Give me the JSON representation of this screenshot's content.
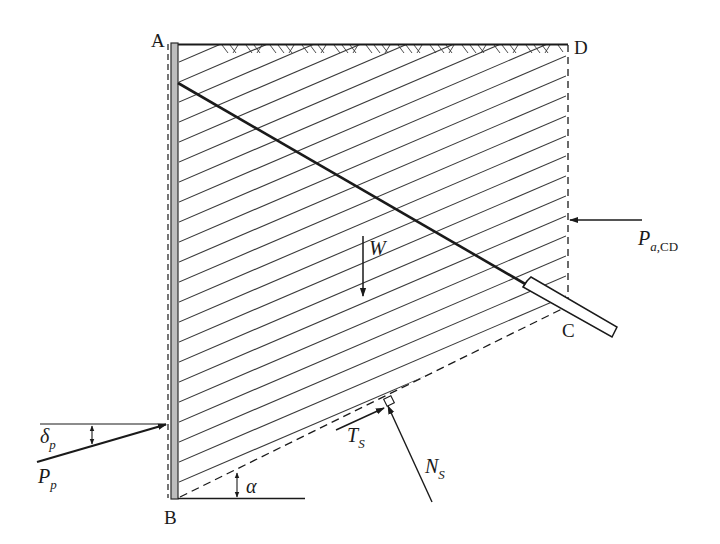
{
  "diagram": {
    "type": "retaining-wall-anchor-stability-wedge",
    "points": [
      {
        "id": "A",
        "label": "A"
      },
      {
        "id": "B",
        "label": "B"
      },
      {
        "id": "C",
        "label": "C"
      },
      {
        "id": "D",
        "label": "D"
      }
    ],
    "forces": {
      "weight": {
        "symbol": "W"
      },
      "active_pressure": {
        "symbol": "P",
        "subscript_italic": "a",
        "subscript_roman": ",CD"
      },
      "passive_pressure": {
        "symbol": "P",
        "subscript": "p"
      },
      "passive_angle": {
        "symbol": "δ",
        "subscript": "p"
      },
      "shear_force": {
        "symbol": "T",
        "subscript": "S"
      },
      "normal_force": {
        "symbol": "N",
        "subscript": "S"
      },
      "base_angle": {
        "symbol": "α"
      }
    },
    "colors": {
      "line": "#1a1a1a",
      "hatch": "#3a3a3a",
      "wall_fill": "#bdbdbd",
      "background": "#ffffff"
    }
  }
}
